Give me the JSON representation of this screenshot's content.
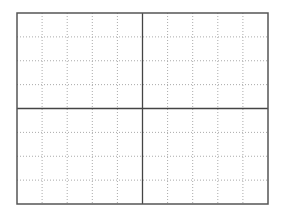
{
  "grid": {
    "left": 17,
    "top": 13,
    "width": 251,
    "height": 191,
    "columns": 10,
    "rows": 8,
    "border_color": "#555555",
    "major_color": "#444444",
    "minor_color": "#aaaaaa",
    "background": "#ffffff"
  }
}
